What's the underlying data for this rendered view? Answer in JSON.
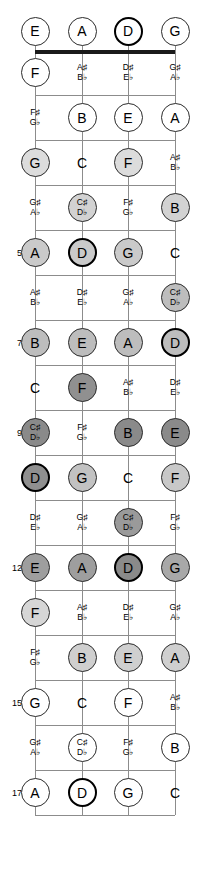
{
  "diagram": {
    "instrument": "4-string bass",
    "tuning": [
      "E",
      "A",
      "D",
      "G"
    ],
    "fret_count": 17,
    "root_note": "D",
    "colors": {
      "nut": "#1a1a1a",
      "fretline": "#8c8c8c",
      "string": "#8c8c8c",
      "note_text": "#000000",
      "root_border": "#000000"
    }
  },
  "fret_numbers": [
    {
      "fret": 5,
      "label": "5"
    },
    {
      "fret": 7,
      "label": "7"
    },
    {
      "fret": 9,
      "label": "9"
    },
    {
      "fret": 12,
      "label": "12"
    },
    {
      "fret": 15,
      "label": "15"
    },
    {
      "fret": 17,
      "label": "17"
    }
  ],
  "strings": [
    {
      "index": 0,
      "open": "E",
      "x": 35
    },
    {
      "index": 1,
      "open": "A",
      "x": 82
    },
    {
      "index": 2,
      "open": "D",
      "x": 128
    },
    {
      "index": 3,
      "open": "G",
      "x": 175
    }
  ],
  "notes": [
    {
      "fret": 0,
      "string": 0,
      "label": "E",
      "style": "ring",
      "fill": "#ffffff"
    },
    {
      "fret": 0,
      "string": 1,
      "label": "A",
      "style": "ring",
      "fill": "#ffffff"
    },
    {
      "fret": 0,
      "string": 2,
      "label": "D",
      "style": "root",
      "fill": "#ffffff"
    },
    {
      "fret": 0,
      "string": 3,
      "label": "G",
      "style": "ring",
      "fill": "#ffffff"
    },
    {
      "fret": 1,
      "string": 0,
      "label": "F",
      "style": "ring",
      "fill": "#ffffff"
    },
    {
      "fret": 1,
      "string": 1,
      "sharp": "A♯",
      "flat": "B♭",
      "style": "plain"
    },
    {
      "fret": 1,
      "string": 2,
      "sharp": "D♯",
      "flat": "E♭",
      "style": "plain"
    },
    {
      "fret": 1,
      "string": 3,
      "sharp": "G♯",
      "flat": "A♭",
      "style": "plain"
    },
    {
      "fret": 2,
      "string": 0,
      "sharp": "F♯",
      "flat": "G♭",
      "style": "plain"
    },
    {
      "fret": 2,
      "string": 1,
      "label": "B",
      "style": "ring",
      "fill": "#ffffff"
    },
    {
      "fret": 2,
      "string": 2,
      "label": "E",
      "style": "ring",
      "fill": "#ffffff"
    },
    {
      "fret": 2,
      "string": 3,
      "label": "A",
      "style": "ring",
      "fill": "#ffffff"
    },
    {
      "fret": 3,
      "string": 0,
      "label": "G",
      "style": "ring",
      "fill": "#dcdcdc"
    },
    {
      "fret": 3,
      "string": 1,
      "label": "C",
      "style": "plain"
    },
    {
      "fret": 3,
      "string": 2,
      "label": "F",
      "style": "ring",
      "fill": "#dcdcdc"
    },
    {
      "fret": 3,
      "string": 3,
      "sharp": "A♯",
      "flat": "B♭",
      "style": "plain"
    },
    {
      "fret": 4,
      "string": 0,
      "sharp": "G♯",
      "flat": "A♭",
      "style": "plain"
    },
    {
      "fret": 4,
      "string": 1,
      "sharp": "C♯",
      "flat": "D♭",
      "style": "disc",
      "fill": "#d2d2d2"
    },
    {
      "fret": 4,
      "string": 2,
      "sharp": "F♯",
      "flat": "G♭",
      "style": "plain"
    },
    {
      "fret": 4,
      "string": 3,
      "label": "B",
      "style": "ring",
      "fill": "#d2d2d2"
    },
    {
      "fret": 5,
      "string": 0,
      "label": "A",
      "style": "ring",
      "fill": "#cacaca"
    },
    {
      "fret": 5,
      "string": 1,
      "label": "D",
      "style": "root",
      "fill": "#cacaca"
    },
    {
      "fret": 5,
      "string": 2,
      "label": "G",
      "style": "ring",
      "fill": "#cacaca"
    },
    {
      "fret": 5,
      "string": 3,
      "label": "C",
      "style": "plain"
    },
    {
      "fret": 6,
      "string": 0,
      "sharp": "A♯",
      "flat": "B♭",
      "style": "plain"
    },
    {
      "fret": 6,
      "string": 1,
      "sharp": "D♯",
      "flat": "E♭",
      "style": "plain"
    },
    {
      "fret": 6,
      "string": 2,
      "sharp": "G♯",
      "flat": "A♭",
      "style": "plain"
    },
    {
      "fret": 6,
      "string": 3,
      "sharp": "C♯",
      "flat": "D♭",
      "style": "disc",
      "fill": "#bdbdbd"
    },
    {
      "fret": 7,
      "string": 0,
      "label": "B",
      "style": "ring",
      "fill": "#bdbdbd"
    },
    {
      "fret": 7,
      "string": 1,
      "label": "E",
      "style": "ring",
      "fill": "#bdbdbd"
    },
    {
      "fret": 7,
      "string": 2,
      "label": "A",
      "style": "ring",
      "fill": "#bdbdbd"
    },
    {
      "fret": 7,
      "string": 3,
      "label": "D",
      "style": "root",
      "fill": "#bdbdbd"
    },
    {
      "fret": 8,
      "string": 0,
      "label": "C",
      "style": "plain"
    },
    {
      "fret": 8,
      "string": 1,
      "label": "F",
      "style": "ring",
      "fill": "#909090"
    },
    {
      "fret": 8,
      "string": 2,
      "sharp": "A♯",
      "flat": "B♭",
      "style": "plain"
    },
    {
      "fret": 8,
      "string": 3,
      "sharp": "D♯",
      "flat": "E♭",
      "style": "plain"
    },
    {
      "fret": 9,
      "string": 0,
      "sharp": "C♯",
      "flat": "D♭",
      "style": "disc",
      "fill": "#8a8a8a"
    },
    {
      "fret": 9,
      "string": 1,
      "sharp": "F♯",
      "flat": "G♭",
      "style": "plain"
    },
    {
      "fret": 9,
      "string": 2,
      "label": "B",
      "style": "ring",
      "fill": "#8a8a8a"
    },
    {
      "fret": 9,
      "string": 3,
      "label": "E",
      "style": "ring",
      "fill": "#8a8a8a"
    },
    {
      "fret": 10,
      "string": 0,
      "label": "D",
      "style": "root",
      "fill": "#8f8f8f"
    },
    {
      "fret": 10,
      "string": 1,
      "label": "G",
      "style": "ring",
      "fill": "#c2c2c2"
    },
    {
      "fret": 10,
      "string": 2,
      "label": "C",
      "style": "plain"
    },
    {
      "fret": 10,
      "string": 3,
      "label": "F",
      "style": "ring",
      "fill": "#c8c8c8"
    },
    {
      "fret": 11,
      "string": 0,
      "sharp": "D♯",
      "flat": "E♭",
      "style": "plain"
    },
    {
      "fret": 11,
      "string": 1,
      "sharp": "G♯",
      "flat": "A♭",
      "style": "plain"
    },
    {
      "fret": 11,
      "string": 2,
      "sharp": "C♯",
      "flat": "D♭",
      "style": "disc",
      "fill": "#9a9a9a"
    },
    {
      "fret": 11,
      "string": 3,
      "sharp": "F♯",
      "flat": "G♭",
      "style": "plain"
    },
    {
      "fret": 12,
      "string": 0,
      "label": "E",
      "style": "ring",
      "fill": "#9e9e9e"
    },
    {
      "fret": 12,
      "string": 1,
      "label": "A",
      "style": "ring",
      "fill": "#9e9e9e"
    },
    {
      "fret": 12,
      "string": 2,
      "label": "D",
      "style": "root",
      "fill": "#8a8a8a"
    },
    {
      "fret": 12,
      "string": 3,
      "label": "G",
      "style": "ring",
      "fill": "#a8a8a8"
    },
    {
      "fret": 13,
      "string": 0,
      "label": "F",
      "style": "ring",
      "fill": "#d6d6d6"
    },
    {
      "fret": 13,
      "string": 1,
      "sharp": "A♯",
      "flat": "B♭",
      "style": "plain"
    },
    {
      "fret": 13,
      "string": 2,
      "sharp": "D♯",
      "flat": "E♭",
      "style": "plain"
    },
    {
      "fret": 13,
      "string": 3,
      "sharp": "G♯",
      "flat": "A♭",
      "style": "plain"
    },
    {
      "fret": 14,
      "string": 0,
      "sharp": "F♯",
      "flat": "G♭",
      "style": "plain"
    },
    {
      "fret": 14,
      "string": 1,
      "label": "B",
      "style": "ring",
      "fill": "#cfcfcf"
    },
    {
      "fret": 14,
      "string": 2,
      "label": "E",
      "style": "ring",
      "fill": "#cfcfcf"
    },
    {
      "fret": 14,
      "string": 3,
      "label": "A",
      "style": "ring",
      "fill": "#cfcfcf"
    },
    {
      "fret": 15,
      "string": 0,
      "label": "G",
      "style": "ring",
      "fill": "#ffffff"
    },
    {
      "fret": 15,
      "string": 1,
      "label": "C",
      "style": "plain"
    },
    {
      "fret": 15,
      "string": 2,
      "label": "F",
      "style": "ring",
      "fill": "#ffffff"
    },
    {
      "fret": 15,
      "string": 3,
      "sharp": "A♯",
      "flat": "B♭",
      "style": "plain"
    },
    {
      "fret": 16,
      "string": 0,
      "sharp": "G♯",
      "flat": "A♭",
      "style": "plain"
    },
    {
      "fret": 16,
      "string": 1,
      "sharp": "C♯",
      "flat": "D♭",
      "style": "disc",
      "fill": "#ffffff"
    },
    {
      "fret": 16,
      "string": 2,
      "sharp": "F♯",
      "flat": "G♭",
      "style": "plain"
    },
    {
      "fret": 16,
      "string": 3,
      "label": "B",
      "style": "ring",
      "fill": "#ffffff"
    },
    {
      "fret": 17,
      "string": 0,
      "label": "A",
      "style": "ring",
      "fill": "#ffffff"
    },
    {
      "fret": 17,
      "string": 1,
      "label": "D",
      "style": "root",
      "fill": "#ffffff"
    },
    {
      "fret": 17,
      "string": 2,
      "label": "G",
      "style": "ring",
      "fill": "#ffffff"
    },
    {
      "fret": 17,
      "string": 3,
      "label": "C",
      "style": "plain"
    }
  ]
}
